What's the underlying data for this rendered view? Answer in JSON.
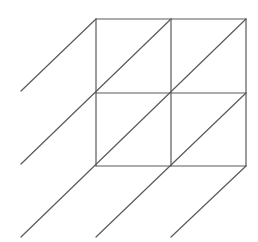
{
  "diagram": {
    "type": "lattice-multiplication-grid",
    "rows": 2,
    "cols": 2,
    "line_color": "#5a5a5a",
    "line_width": 1.2,
    "background": "#ffffff",
    "grid": {
      "x": [
        96,
        171,
        246
      ],
      "y": [
        19,
        93,
        166
      ]
    },
    "diagonals": [
      {
        "x1": 96,
        "y1": 19,
        "x2": 21,
        "y2": 91
      },
      {
        "x1": 171,
        "y1": 19,
        "x2": 21,
        "y2": 164
      },
      {
        "x1": 246,
        "y1": 19,
        "x2": 21,
        "y2": 237
      },
      {
        "x1": 246,
        "y1": 93,
        "x2": 96,
        "y2": 237
      },
      {
        "x1": 246,
        "y1": 166,
        "x2": 171,
        "y2": 237
      }
    ]
  }
}
